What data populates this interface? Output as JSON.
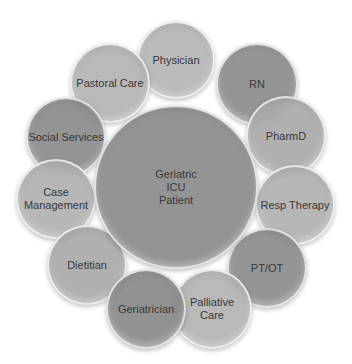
{
  "diagram": {
    "center": {
      "label": "Geriatric\nICU\nPatient",
      "cx": 176,
      "cy": 187,
      "r": 82,
      "color": "#8c8c8c"
    },
    "nodes": [
      {
        "id": "physician",
        "label": "Physician",
        "cx": 176,
        "cy": 60,
        "r": 39,
        "color": "#b6b6b6"
      },
      {
        "id": "rn",
        "label": "RN",
        "cx": 257,
        "cy": 84,
        "r": 41,
        "color": "#8e8e8e"
      },
      {
        "id": "pharmd",
        "label": "PharmD",
        "cx": 286,
        "cy": 136,
        "r": 40,
        "color": "#ababab"
      },
      {
        "id": "resp-therapy",
        "label": "Resp Therapy",
        "cx": 295,
        "cy": 205,
        "r": 40,
        "color": "#b2b2b2"
      },
      {
        "id": "pt-ot",
        "label": "PT/OT",
        "cx": 267,
        "cy": 268,
        "r": 40,
        "color": "#8e8e8e"
      },
      {
        "id": "palliative-care",
        "label": "Palliative\nCare",
        "cx": 212,
        "cy": 309,
        "r": 40,
        "color": "#b4b4b4"
      },
      {
        "id": "geriatrician",
        "label": "Geriatrician",
        "cx": 146,
        "cy": 309,
        "r": 40,
        "color": "#8a8a8a"
      },
      {
        "id": "dietitian",
        "label": "Dietitian",
        "cx": 87,
        "cy": 265,
        "r": 40,
        "color": "#ababab"
      },
      {
        "id": "case-management",
        "label": "Case\nManagement",
        "cx": 56,
        "cy": 199,
        "r": 40,
        "color": "#b2b2b2"
      },
      {
        "id": "social-services",
        "label": "Social Services",
        "cx": 66,
        "cy": 137,
        "r": 40,
        "color": "#8c8c8c"
      },
      {
        "id": "pastoral-care",
        "label": "Pastoral Care",
        "cx": 110,
        "cy": 83,
        "r": 40,
        "color": "#b4b4b4"
      }
    ]
  }
}
